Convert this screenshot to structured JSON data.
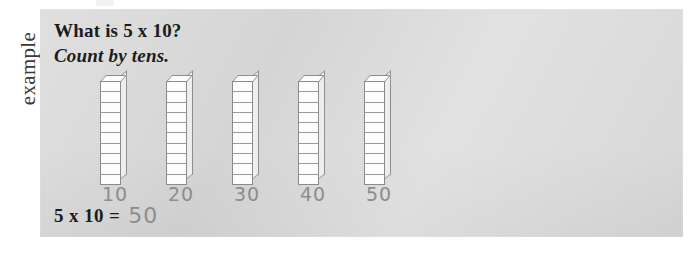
{
  "page": {
    "margin_label": "example",
    "panel_color": "#d5d5d5",
    "ink_color": "#1c1c1c",
    "handwriting_color": "#8d8d8d"
  },
  "problem": {
    "question": "What is 5 x 10?",
    "instruction": "Count by tens.",
    "expression": "5 x 10 =",
    "answer": "50"
  },
  "manipulatives": {
    "type": "base-ten-rods",
    "rod_count": 5,
    "units_per_rod": 10,
    "rods": [
      {
        "label": "10",
        "units": 10,
        "x": 0
      },
      {
        "label": "20",
        "units": 10,
        "x": 66
      },
      {
        "label": "30",
        "units": 10,
        "x": 132
      },
      {
        "label": "40",
        "units": 10,
        "x": 198
      },
      {
        "label": "50",
        "units": 10,
        "x": 264
      }
    ]
  }
}
